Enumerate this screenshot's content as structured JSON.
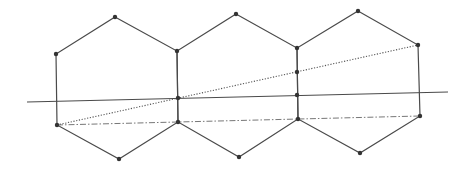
{
  "diagram": {
    "width": 471,
    "height": 171,
    "colors": {
      "edge": "#4a4a4a",
      "vertex": "#333333",
      "background": "#ffffff"
    },
    "hexagons": [
      {
        "name": "hexagon-1",
        "points": [
          [
            115,
            17
          ],
          [
            177,
            51
          ],
          [
            178,
            122
          ],
          [
            119,
            159
          ],
          [
            57,
            125
          ],
          [
            56,
            54
          ]
        ]
      },
      {
        "name": "hexagon-2",
        "points": [
          [
            236,
            14
          ],
          [
            297,
            48
          ],
          [
            298,
            119
          ],
          [
            239,
            157
          ],
          [
            178,
            122
          ],
          [
            177,
            51
          ]
        ]
      },
      {
        "name": "hexagon-3",
        "points": [
          [
            358,
            11
          ],
          [
            418,
            45
          ],
          [
            420,
            116
          ],
          [
            360,
            153
          ],
          [
            298,
            119
          ],
          [
            297,
            48
          ]
        ]
      }
    ],
    "lines": [
      {
        "name": "solid-transversal-line",
        "style": "solid",
        "from": [
          27,
          102
        ],
        "to": [
          448,
          92
        ]
      },
      {
        "name": "dotted-diagonal-line",
        "style": "dotted",
        "from": [
          57,
          125
        ],
        "to": [
          418,
          45
        ]
      },
      {
        "name": "dashdot-base-line",
        "style": "dashdot",
        "from": [
          57,
          125
        ],
        "to": [
          420,
          116
        ]
      }
    ],
    "extra_points": [
      [
        178,
        98
      ],
      [
        297,
        72
      ],
      [
        297,
        95
      ]
    ]
  }
}
